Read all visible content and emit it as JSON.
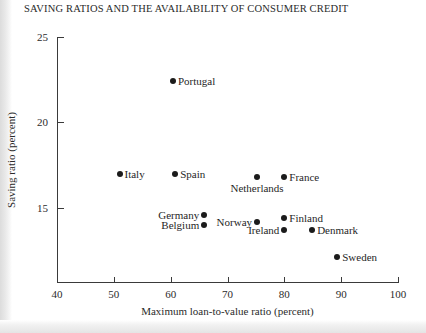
{
  "figure": {
    "title": "SAVING RATIOS AND THE AVAILABILITY OF CONSUMER CREDIT",
    "background": "#ffffff",
    "ink_color": "#1b1b1b"
  },
  "chart_data": {
    "type": "scatter",
    "title": "SAVING RATIOS AND THE AVAILABILITY OF CONSUMER CREDIT",
    "xlabel": "Maximum loan-to-value ratio (percent)",
    "ylabel": "Saving ratio (percent)",
    "xlim": [
      40,
      100
    ],
    "ylim": [
      10.6,
      25
    ],
    "xticks": [
      40,
      50,
      60,
      70,
      80,
      90,
      100
    ],
    "yticks": [
      15,
      20,
      25
    ],
    "grid": false,
    "legend": "none",
    "points": [
      {
        "name": "Portugal",
        "x": 60.4,
        "y": 22.4,
        "label_pos": "right"
      },
      {
        "name": "Italy",
        "x": 51.0,
        "y": 17.0,
        "label_pos": "right"
      },
      {
        "name": "Spain",
        "x": 60.8,
        "y": 17.0,
        "label_pos": "right"
      },
      {
        "name": "Netherlands",
        "x": 75.2,
        "y": 16.8,
        "label_pos": "below"
      },
      {
        "name": "France",
        "x": 80.0,
        "y": 16.8,
        "label_pos": "right"
      },
      {
        "name": "Germany",
        "x": 65.9,
        "y": 14.6,
        "label_pos": "left"
      },
      {
        "name": "Belgium",
        "x": 65.9,
        "y": 14.0,
        "label_pos": "left"
      },
      {
        "name": "Norway",
        "x": 75.2,
        "y": 14.2,
        "label_pos": "left"
      },
      {
        "name": "Finland",
        "x": 80.0,
        "y": 14.4,
        "label_pos": "right"
      },
      {
        "name": "Ireland",
        "x": 80.0,
        "y": 13.7,
        "label_pos": "left"
      },
      {
        "name": "Denmark",
        "x": 84.9,
        "y": 13.7,
        "label_pos": "right"
      },
      {
        "name": "Sweden",
        "x": 89.3,
        "y": 12.1,
        "label_pos": "right"
      }
    ]
  }
}
